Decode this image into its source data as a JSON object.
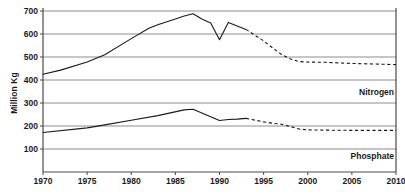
{
  "chart_data": {
    "type": "line",
    "title": "",
    "xlabel": "",
    "ylabel": "Million Kg",
    "xlim": [
      1970,
      2010
    ],
    "ylim": [
      0,
      700
    ],
    "grid": true,
    "legend_position": "inline-right",
    "xticks": [
      1970,
      1975,
      1980,
      1985,
      1990,
      1995,
      2000,
      2005,
      2010
    ],
    "yticks": [
      100,
      200,
      300,
      400,
      500,
      600,
      700
    ],
    "series": [
      {
        "name": "Nitrogen",
        "label": "Nitrogen",
        "color": "#1a1a1a",
        "solid": {
          "x": [
            1970,
            1972,
            1975,
            1977,
            1980,
            1982,
            1983,
            1985,
            1986,
            1987,
            1988,
            1989,
            1990,
            1991,
            1992,
            1993
          ],
          "y": [
            425,
            443,
            478,
            510,
            580,
            625,
            640,
            665,
            678,
            688,
            665,
            648,
            575,
            650,
            635,
            620
          ]
        },
        "dashed": {
          "x": [
            1993,
            1995,
            1996,
            1997,
            1998,
            1999,
            2000,
            2002,
            2005,
            2008,
            2010
          ],
          "y": [
            620,
            570,
            540,
            512,
            492,
            480,
            478,
            477,
            472,
            469,
            467
          ]
        }
      },
      {
        "name": "Phosphate",
        "label": "Phosphate",
        "color": "#1a1a1a",
        "solid": {
          "x": [
            1970,
            1975,
            1977,
            1980,
            1983,
            1986,
            1987,
            1989,
            1990,
            1991,
            1992,
            1993
          ],
          "y": [
            172,
            192,
            205,
            225,
            245,
            270,
            273,
            240,
            224,
            228,
            230,
            233
          ]
        },
        "dashed": {
          "x": [
            1993,
            1995,
            1996,
            1997,
            1998,
            1999,
            2000,
            2002,
            2005,
            2008,
            2010
          ],
          "y": [
            233,
            218,
            212,
            208,
            198,
            187,
            183,
            182,
            181,
            181,
            181
          ]
        }
      }
    ]
  },
  "axis": {
    "y_title": "Million Kg"
  }
}
